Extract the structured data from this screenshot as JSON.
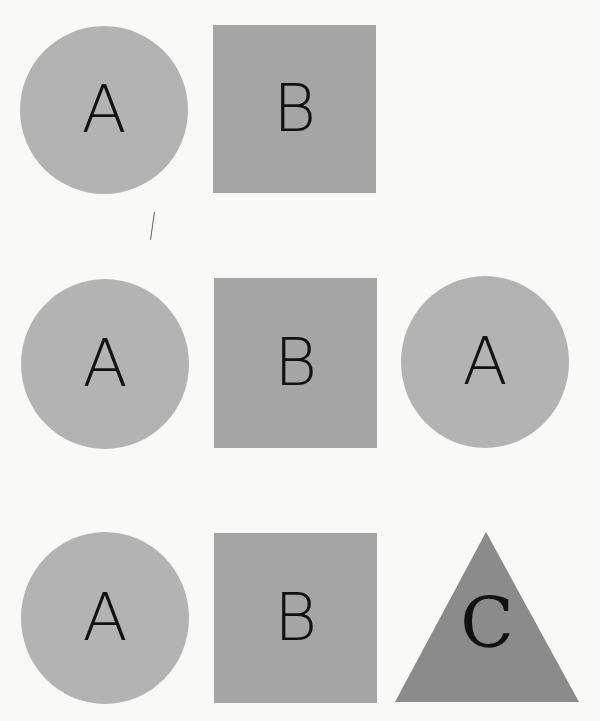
{
  "colors": {
    "background": "#f9f9f8",
    "circle": "#b3b3b3",
    "square": "#a5a5a5",
    "triangle": "#8b8b8b",
    "letter": "#111111"
  },
  "rows": [
    {
      "shapes": [
        {
          "type": "circle",
          "label": "A"
        },
        {
          "type": "square",
          "label": "B"
        }
      ]
    },
    {
      "shapes": [
        {
          "type": "circle",
          "label": "A"
        },
        {
          "type": "square",
          "label": "B"
        },
        {
          "type": "circle",
          "label": "A"
        }
      ]
    },
    {
      "shapes": [
        {
          "type": "circle",
          "label": "A"
        },
        {
          "type": "square",
          "label": "B"
        },
        {
          "type": "triangle",
          "label": "C"
        }
      ]
    }
  ]
}
